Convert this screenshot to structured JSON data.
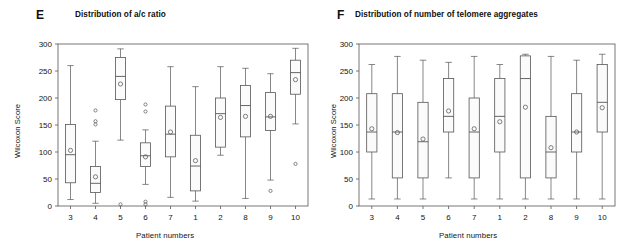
{
  "figure": {
    "width": 637,
    "height": 250,
    "background": "#ffffff",
    "line_color": "#555555",
    "text_color": "#141414"
  },
  "panels": [
    {
      "letter": "E",
      "title": "Distribution of a/c ratio",
      "xlabel": "Patient numbers",
      "ylabel": "Wilcoxon Score"
    },
    {
      "letter": "F",
      "title": "Distribution of number of telomere aggregates",
      "xlabel": "Patient numbers",
      "ylabel": "Wilcoxon Score"
    }
  ],
  "chart_data": [
    {
      "type": "box",
      "panel": "E",
      "title": "Distribution of a/c ratio",
      "xlabel": "Patient numbers",
      "ylabel": "Wilcoxon Score",
      "ylim": [
        0,
        300
      ],
      "yticks": [
        0,
        50,
        100,
        150,
        200,
        250,
        300
      ],
      "grid": false,
      "legend": "none",
      "categories": [
        "3",
        "4",
        "5",
        "6",
        "7",
        "1",
        "2",
        "8",
        "9",
        "10"
      ],
      "boxes": [
        {
          "category": "3",
          "whisker_low": 12,
          "q1": 43,
          "median": 95,
          "q3": 151,
          "whisker_high": 260,
          "mean": 103,
          "outliers": []
        },
        {
          "category": "4",
          "whisker_low": 5,
          "q1": 25,
          "median": 42,
          "q3": 73,
          "whisker_high": 120,
          "mean": 54,
          "outliers": [
            177,
            157,
            151
          ]
        },
        {
          "category": "5",
          "whisker_low": 122,
          "q1": 197,
          "median": 240,
          "q3": 275,
          "whisker_high": 291,
          "mean": 226,
          "outliers": [
            3
          ]
        },
        {
          "category": "6",
          "whisker_low": 40,
          "q1": 73,
          "median": 93,
          "q3": 117,
          "whisker_high": 141,
          "mean": 91,
          "outliers": [
            188,
            175,
            8,
            3
          ]
        },
        {
          "category": "7",
          "whisker_low": 16,
          "q1": 91,
          "median": 133,
          "q3": 185,
          "whisker_high": 258,
          "mean": 137,
          "outliers": []
        },
        {
          "category": "1",
          "whisker_low": 9,
          "q1": 28,
          "median": 74,
          "q3": 131,
          "whisker_high": 221,
          "mean": 84,
          "outliers": []
        },
        {
          "category": "2",
          "whisker_low": 94,
          "q1": 109,
          "median": 171,
          "q3": 200,
          "whisker_high": 258,
          "mean": 164,
          "outliers": []
        },
        {
          "category": "8",
          "whisker_low": 14,
          "q1": 128,
          "median": 186,
          "q3": 223,
          "whisker_high": 255,
          "mean": 166,
          "outliers": []
        },
        {
          "category": "9",
          "whisker_low": 48,
          "q1": 140,
          "median": 165,
          "q3": 210,
          "whisker_high": 245,
          "mean": 166,
          "outliers": [
            28
          ]
        },
        {
          "category": "10",
          "whisker_low": 152,
          "q1": 207,
          "median": 247,
          "q3": 270,
          "whisker_high": 292,
          "mean": 234,
          "outliers": [
            78
          ]
        }
      ]
    },
    {
      "type": "box",
      "panel": "F",
      "title": "Distribution of number of telomere aggregates",
      "xlabel": "Patient numbers",
      "ylabel": "Wilcoxon Score",
      "ylim": [
        0,
        300
      ],
      "yticks": [
        0,
        50,
        100,
        150,
        200,
        250,
        300
      ],
      "grid": false,
      "legend": "none",
      "categories": [
        "3",
        "4",
        "5",
        "6",
        "7",
        "1",
        "2",
        "8",
        "9",
        "10"
      ],
      "boxes": [
        {
          "category": "3",
          "whisker_low": 13,
          "q1": 100,
          "median": 137,
          "q3": 208,
          "whisker_high": 262,
          "mean": 143,
          "outliers": []
        },
        {
          "category": "4",
          "whisker_low": 13,
          "q1": 52,
          "median": 137,
          "q3": 208,
          "whisker_high": 277,
          "mean": 136,
          "outliers": []
        },
        {
          "category": "5",
          "whisker_low": 13,
          "q1": 52,
          "median": 119,
          "q3": 192,
          "whisker_high": 270,
          "mean": 124,
          "outliers": []
        },
        {
          "category": "6",
          "whisker_low": 52,
          "q1": 137,
          "median": 166,
          "q3": 236,
          "whisker_high": 266,
          "mean": 176,
          "outliers": []
        },
        {
          "category": "7",
          "whisker_low": 13,
          "q1": 52,
          "median": 137,
          "q3": 200,
          "whisker_high": 277,
          "mean": 143,
          "outliers": []
        },
        {
          "category": "1",
          "whisker_low": 13,
          "q1": 100,
          "median": 166,
          "q3": 236,
          "whisker_high": 262,
          "mean": 156,
          "outliers": []
        },
        {
          "category": "2",
          "whisker_low": 13,
          "q1": 52,
          "median": 236,
          "q3": 278,
          "whisker_high": 281,
          "mean": 183,
          "outliers": []
        },
        {
          "category": "8",
          "whisker_low": 13,
          "q1": 52,
          "median": 100,
          "q3": 166,
          "whisker_high": 277,
          "mean": 108,
          "outliers": []
        },
        {
          "category": "9",
          "whisker_low": 13,
          "q1": 100,
          "median": 137,
          "q3": 208,
          "whisker_high": 270,
          "mean": 137,
          "outliers": []
        },
        {
          "category": "10",
          "whisker_low": 13,
          "q1": 137,
          "median": 192,
          "q3": 262,
          "whisker_high": 281,
          "mean": 182,
          "outliers": []
        }
      ]
    }
  ]
}
